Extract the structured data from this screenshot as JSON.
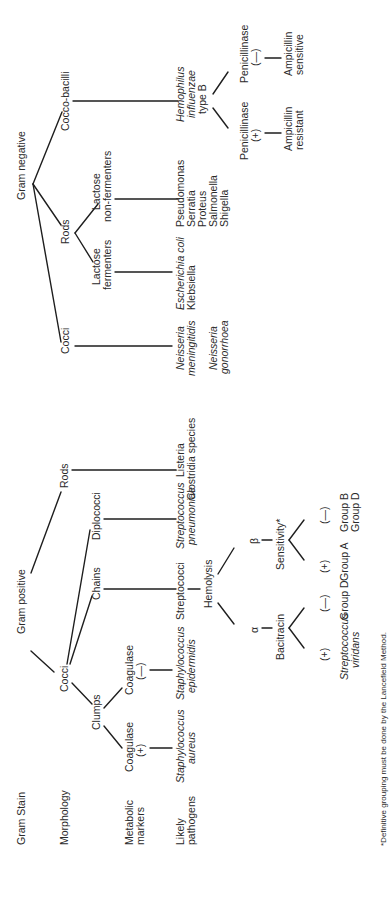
{
  "rows": {
    "gram_stain": "Gram Stain",
    "morphology": "Morphology",
    "metabolic_markers": [
      "Metabolic",
      "markers"
    ],
    "likely_pathogens": [
      "Likely",
      "pathogens"
    ]
  },
  "gram_positive": {
    "label": "Gram positive",
    "cocci": {
      "label": "Cocci",
      "clumps": {
        "label": "Clumps",
        "coagulase_pos": {
          "label": "Coagulase",
          "sign": "(+)",
          "pathogen": [
            "Staphylococcus",
            "aureus"
          ]
        },
        "coagulase_neg": {
          "label": "Coagulase",
          "sign": "(—)",
          "pathogen": [
            "Staphylococcus",
            "epidermidis"
          ]
        }
      },
      "chains": {
        "label": "Chains",
        "pathogen": "Streptococci",
        "hemolysis": {
          "label": "Hemolysis",
          "alpha": {
            "label": "α",
            "test": "Bacitracin",
            "pos": {
              "sign": "(+)",
              "result": [
                "Streptococcus",
                "viridans"
              ]
            },
            "neg": {
              "sign": "(—)",
              "result": [
                "Group D"
              ]
            }
          },
          "beta": {
            "label": "β",
            "test": "Sensitivity*",
            "pos": {
              "sign": "(+)",
              "result": [
                "Group A"
              ]
            },
            "neg": {
              "sign": "(—)",
              "result": [
                "Group B",
                "Group D"
              ]
            }
          }
        }
      },
      "diplococci": {
        "label": "Diplococci",
        "pathogen": [
          "Streptococcus",
          "pneumoniae"
        ]
      }
    },
    "rods": {
      "label": "Rods",
      "pathogens": [
        "Listeria",
        "Clostridia species"
      ]
    }
  },
  "gram_negative": {
    "label": "Gram negative",
    "cocci": {
      "label": "Cocci",
      "pathogens": [
        [
          "Neisseria",
          "meningitidis"
        ],
        [
          "Neisseria",
          "gonorrhoea"
        ]
      ]
    },
    "rods": {
      "label": "Rods",
      "lactose_fermenters": {
        "label": [
          "Lactose",
          "fermenters"
        ],
        "pathogens": [
          "Escherichia coli",
          "Klebsiella"
        ]
      },
      "lactose_non_fermenters": {
        "label": [
          "Lactose",
          "non-fermenters"
        ],
        "pathogens": [
          "Pseudomonas",
          "Serratia",
          "Proteus",
          "Salmonella",
          "Shigella"
        ]
      }
    },
    "cocco_bacilli": {
      "label": "Cocco-bacilli",
      "pathogen": [
        "Hemophilus",
        "influenzae",
        "type B"
      ],
      "penicillinase_pos": {
        "label": "Penicillinase",
        "sign": "(+)",
        "result": [
          "Ampicillin",
          "resistant"
        ]
      },
      "penicillinase_neg": {
        "label": "Penicillinase",
        "sign": "(—)",
        "result": [
          "Ampicillin",
          "sensitive"
        ]
      }
    }
  },
  "footnote": "*Definitive grouping must be done by the Lancefield Method."
}
